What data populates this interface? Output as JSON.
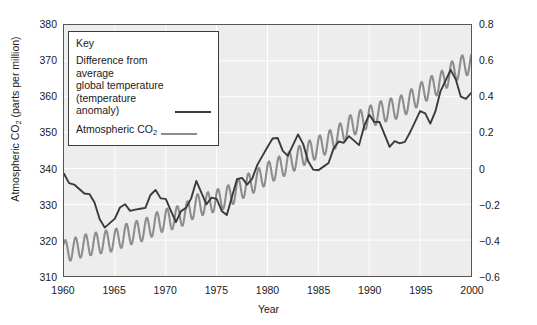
{
  "chart_data": {
    "type": "line",
    "title": "",
    "xlabel": "Year",
    "ylabel": "Atmospheric CO2 (parts per million)",
    "ylabel_right": "Temperature anomaly (°C)",
    "xlim": [
      1960,
      2000
    ],
    "ylim": [
      310,
      380
    ],
    "ylim_right": [
      -0.6,
      0.8
    ],
    "xticks": [
      1960,
      1965,
      1970,
      1975,
      1980,
      1985,
      1990,
      1995,
      2000
    ],
    "yticks_left": [
      310,
      320,
      330,
      340,
      350,
      360,
      370,
      380
    ],
    "yticks_right": [
      -0.6,
      -0.4,
      -0.2,
      0,
      0.2,
      0.4,
      0.6,
      0.8
    ],
    "grid": true,
    "legend_position": "upper-left",
    "series": [
      {
        "name": "Atmospheric CO2",
        "axis": "left",
        "color": "#8d8d8d",
        "units": "parts per million",
        "note": "Annual mean trend with seasonal sawtooth oscillation of about 6 ppm peak-to-peak",
        "x": [
          1960,
          1961,
          1962,
          1963,
          1964,
          1965,
          1966,
          1967,
          1968,
          1969,
          1970,
          1971,
          1972,
          1973,
          1974,
          1975,
          1976,
          1977,
          1978,
          1979,
          1980,
          1981,
          1982,
          1983,
          1984,
          1985,
          1986,
          1987,
          1988,
          1989,
          1990,
          1991,
          1992,
          1993,
          1994,
          1995,
          1996,
          1997,
          1998,
          1999,
          2000
        ],
        "values": [
          316.9,
          317.6,
          318.5,
          319.0,
          319.6,
          320.0,
          321.4,
          322.2,
          323.0,
          324.6,
          325.7,
          326.3,
          327.5,
          329.7,
          330.2,
          331.1,
          332.0,
          333.8,
          335.4,
          336.8,
          338.7,
          340.1,
          341.4,
          343.0,
          344.6,
          346.0,
          347.4,
          349.2,
          351.6,
          353.1,
          354.4,
          355.6,
          356.4,
          357.1,
          358.8,
          360.8,
          362.6,
          363.8,
          366.6,
          368.3,
          369.5
        ]
      },
      {
        "name": "Difference from average global temperature (temperature anomaly)",
        "axis": "right",
        "color": "#3a3a3a",
        "units": "°C",
        "x": [
          1960,
          1961,
          1962,
          1963,
          1964,
          1965,
          1966,
          1967,
          1968,
          1969,
          1970,
          1971,
          1972,
          1973,
          1974,
          1975,
          1976,
          1977,
          1978,
          1979,
          1980,
          1981,
          1982,
          1983,
          1984,
          1985,
          1986,
          1987,
          1988,
          1989,
          1990,
          1991,
          1992,
          1993,
          1994,
          1995,
          1996,
          1997,
          1998,
          1999,
          2000
        ],
        "values": [
          -0.03,
          -0.09,
          -0.14,
          -0.19,
          -0.33,
          -0.28,
          -0.2,
          -0.23,
          -0.22,
          -0.12,
          -0.17,
          -0.3,
          -0.22,
          -0.07,
          -0.2,
          -0.17,
          -0.26,
          -0.06,
          -0.09,
          0.02,
          0.12,
          0.17,
          0.07,
          0.19,
          0.04,
          -0.01,
          0.03,
          0.15,
          0.18,
          0.13,
          0.3,
          0.26,
          0.12,
          0.14,
          0.2,
          0.32,
          0.25,
          0.43,
          0.55,
          0.4,
          0.42
        ]
      }
    ]
  },
  "axes": {
    "left": {
      "title_part1": "Atmospheric CO",
      "title_sub": "2",
      "title_part2": " (parts per million)",
      "ticks": [
        "380",
        "370",
        "360",
        "350",
        "340",
        "330",
        "320",
        "310"
      ]
    },
    "right": {
      "title_part1": "Temperature anomaly (",
      "title_sup": "o",
      "title_part2": "C)",
      "ticks": [
        "0.8",
        "0.6",
        "0.4",
        "0.2",
        "0",
        "−0.2",
        "−0.4",
        "−0.6"
      ]
    },
    "bottom": {
      "title": "Year",
      "ticks": [
        "1960",
        "1965",
        "1970",
        "1975",
        "1980",
        "1985",
        "1990",
        "1995",
        "2000"
      ]
    }
  },
  "legend": {
    "title": "Key",
    "entries": [
      {
        "label": "Difference from average\nglobal temperature\n(temperature anomaly)",
        "color": "#3a3a3a"
      },
      {
        "label_part1": "Atmospheric CO",
        "label_sub": "2",
        "color": "#8d8d8d"
      }
    ]
  },
  "colors": {
    "plot_background": "#ededed",
    "grid": "#ffffff",
    "frame": "#555555",
    "co2_line": "#8d8d8d",
    "temperature_line": "#3a3a3a",
    "text": "#1a1a1a"
  }
}
